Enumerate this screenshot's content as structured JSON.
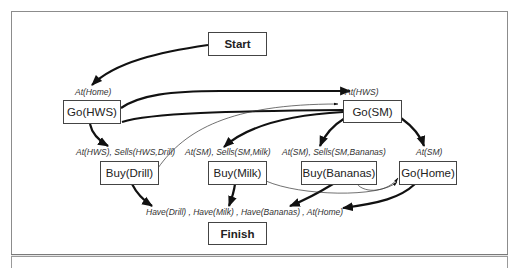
{
  "diagram": {
    "type": "partial-order plan",
    "nodes": {
      "start": "Start",
      "go_hws": "Go(HWS)",
      "go_sm": "Go(SM)",
      "buy_drill": "Buy(Drill)",
      "buy_milk": "Buy(Milk)",
      "buy_bananas": "Buy(Bananas)",
      "go_home": "Go(Home)",
      "finish": "Finish"
    },
    "preconditions": {
      "go_hws": "At(Home)",
      "go_sm": "At(HWS)",
      "buy_drill": "At(HWS), Sells(HWS,Drill)",
      "buy_milk": "At(SM), Sells(SM,Milk)",
      "buy_bananas": "At(SM), Sells(SM,Bananas)",
      "go_home": "At(SM)",
      "finish": "Have(Drill) , Have(Milk) , Have(Bananas) , At(Home)"
    },
    "edges": [
      {
        "from": "Start",
        "to": "Go(HWS)",
        "kind": "causal"
      },
      {
        "from": "Go(HWS)",
        "to": "Go(SM)",
        "kind": "causal"
      },
      {
        "from": "Go(HWS)",
        "to": "Buy(Drill)",
        "kind": "causal"
      },
      {
        "from": "Buy(Drill)",
        "to": "Go(SM)",
        "kind": "ordering"
      },
      {
        "from": "Go(SM)",
        "to": "Buy(Milk)",
        "kind": "causal"
      },
      {
        "from": "Go(SM)",
        "to": "Buy(Bananas)",
        "kind": "causal"
      },
      {
        "from": "Go(SM)",
        "to": "Go(Home)",
        "kind": "causal"
      },
      {
        "from": "Buy(Drill)",
        "to": "Finish",
        "kind": "causal"
      },
      {
        "from": "Buy(Milk)",
        "to": "Finish",
        "kind": "causal"
      },
      {
        "from": "Buy(Bananas)",
        "to": "Finish",
        "kind": "causal"
      },
      {
        "from": "Go(Home)",
        "to": "Finish",
        "kind": "causal"
      },
      {
        "from": "Buy(Milk)",
        "to": "Go(Home)",
        "kind": "ordering"
      },
      {
        "from": "Buy(Bananas)",
        "to": "Go(Home)",
        "kind": "ordering"
      }
    ]
  }
}
